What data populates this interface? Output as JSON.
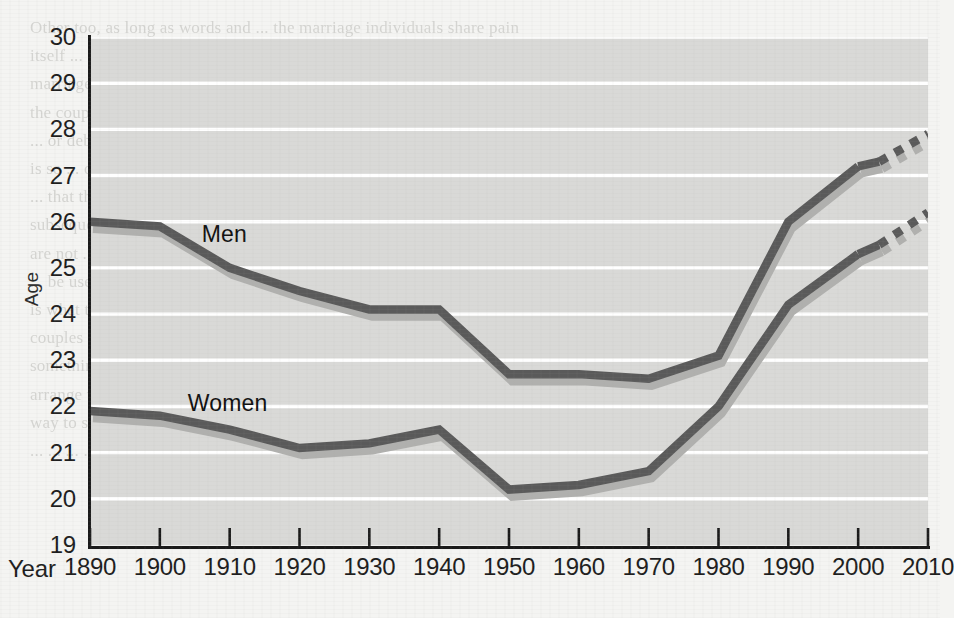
{
  "figure": {
    "y_axis_title": "Age",
    "x_axis_caption": "Year",
    "background_color": "#d9d9d7",
    "gridline_color": "#ffffff",
    "axis_color": "#1a1a1a",
    "line_color": "#5a5a5a",
    "shadow_color": "#b0b0ae",
    "page_color": "#f4f4f2"
  },
  "ticks": {
    "y": [
      "30",
      "29",
      "28",
      "27",
      "26",
      "25",
      "24",
      "23",
      "22",
      "21",
      "20",
      "19"
    ],
    "x": [
      "1890",
      "1900",
      "1910",
      "1920",
      "1930",
      "1940",
      "1950",
      "1960",
      "1970",
      "1980",
      "1990",
      "2000",
      "2010"
    ]
  },
  "labels": {
    "men": "Men",
    "women": "Women"
  },
  "bleed_through_text": "Other too, as long as words and ... the marriage individuals share pain\nitself ... of families ... that one is not the other ... but the\nmarriage entitles a judge to impose the ... institution if it considers\nthe couple separates with this relevant because that is either good\n... or debatable. What is clear is that ... to what whole. We have little that\nis so ... of a contract that assume further and legal ... The general ...\n... that they ... wish. But the ... the ... has been made on ... and\nsubsequent ... The ... is that someone not love ... to ... other ... made a law\nare not ...\n... be used in ... to measure ... only because ... and sex ... but a ... is ...\nis what the individual ... the ... the ... law ... I would assume that some\ncouples might have married and I asked good because one ... that there is ...\nsomething ... is it the case ... of ... to ...\narrange the a case that ... ... ... If ... government another another ... explicit\nway to serving to suggest some ... marriage is the ... is of case of ending a\n... ... ... ... ... ... ... ... ... ...",
  "chart_data": {
    "type": "line",
    "title": "",
    "xlabel": "Year",
    "ylabel": "Age",
    "xlim": [
      1890,
      2010
    ],
    "ylim": [
      19,
      30
    ],
    "grid": true,
    "legend": "inline-labels",
    "x": [
      1890,
      1900,
      1910,
      1920,
      1930,
      1940,
      1950,
      1960,
      1970,
      1980,
      1990,
      2000
    ],
    "series": [
      {
        "name": "Men",
        "values": [
          26.0,
          25.9,
          25.0,
          24.5,
          24.1,
          24.1,
          22.7,
          22.7,
          22.6,
          23.1,
          26.0,
          27.2
        ],
        "projection": {
          "x": [
            2003,
            2010
          ],
          "values": [
            27.3,
            27.9
          ],
          "style": "dashed"
        }
      },
      {
        "name": "Women",
        "values": [
          21.9,
          21.8,
          21.5,
          21.1,
          21.2,
          21.5,
          20.2,
          20.3,
          20.6,
          22.0,
          24.2,
          25.3
        ],
        "projection": {
          "x": [
            2003,
            2010
          ],
          "values": [
            25.5,
            26.2
          ],
          "style": "dashed"
        }
      }
    ]
  }
}
